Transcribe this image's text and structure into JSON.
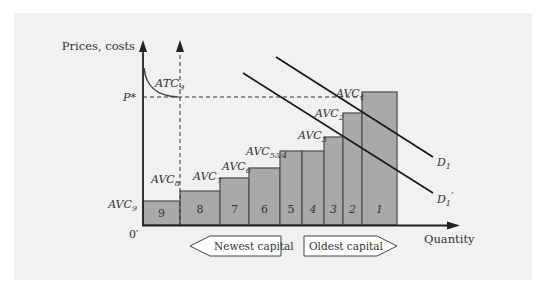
{
  "diagram": {
    "y_axis_label": "Prices, costs",
    "x_axis_label": "Quantity",
    "origin_label": "0′",
    "price_label": "P*",
    "atc_label": {
      "base": "ATC",
      "sub": "9"
    },
    "demand_curves": [
      {
        "base": "D",
        "sub": "1",
        "prime": ""
      },
      {
        "base": "D",
        "sub": "1",
        "prime": "′"
      }
    ],
    "bars": [
      {
        "label": "9",
        "avc": {
          "base": "AVC",
          "sub": "9"
        }
      },
      {
        "label": "8",
        "avc": {
          "base": "AVC",
          "sub": "8"
        }
      },
      {
        "label": "7",
        "avc": {
          "base": "AVC",
          "sub": "7"
        }
      },
      {
        "label": "6",
        "avc": {
          "base": "AVC",
          "sub": "6"
        }
      },
      {
        "label": "5",
        "avc": {
          "base": "AVC",
          "sub": "5&4"
        }
      },
      {
        "label": "4",
        "avc": null
      },
      {
        "label": "3",
        "avc": {
          "base": "AVC",
          "sub": "3"
        }
      },
      {
        "label": "2",
        "avc": {
          "base": "AVC",
          "sub": "2"
        }
      },
      {
        "label": "1",
        "avc": {
          "base": "AVC",
          "sub": "1"
        }
      }
    ],
    "arrows": {
      "left": "Newest capital",
      "right": "Oldest capital"
    },
    "colors": {
      "bar_fill": "#a9a9a9",
      "bar_stroke": "#555555",
      "line": "#222222",
      "panel": "#f1f1f1"
    }
  }
}
